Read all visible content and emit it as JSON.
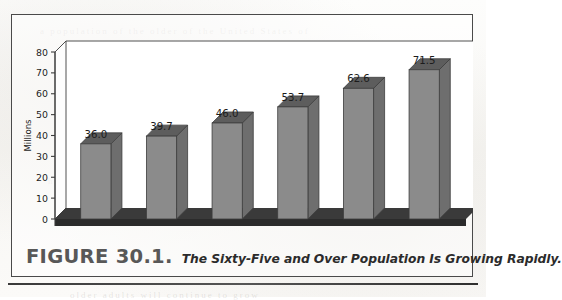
{
  "figure": {
    "number_label": "FIGURE 30.1.",
    "title": "The Sixty-Five and Over Population Is Growing Rapidly.",
    "ghost_lines": [
      "a population of the older of the United States of",
      "the increase in the number of persons over",
      "has been a steady rise in the proportion",
      "older adults will continue to grow"
    ]
  },
  "chart_data": {
    "type": "bar",
    "title": "",
    "subtitle": "",
    "xlabel": "",
    "ylabel": "Millions",
    "categories": [
      "2004",
      "2010",
      "2015",
      "2020",
      "2025",
      "2030"
    ],
    "values": [
      36.0,
      39.7,
      46.0,
      53.7,
      62.6,
      71.5
    ],
    "data_labels": [
      "36.0",
      "39.7",
      "46.0",
      "53.7",
      "62.6",
      "71.5"
    ],
    "yticks": [
      0,
      10,
      20,
      30,
      40,
      50,
      60,
      70,
      80
    ],
    "ytick_labels": [
      "0",
      "10",
      "20",
      "30",
      "40",
      "50",
      "60",
      "70",
      "80"
    ],
    "ylim": [
      0,
      80
    ],
    "grid": false,
    "legend": false,
    "legend_position": "none",
    "three_d": true,
    "colors": {
      "bar_front": "#8b8b8b",
      "bar_top": "#5d5d5d",
      "bar_side": "#6e6e6e",
      "floor": "#2b2b2b",
      "axis": "#3c3c3c",
      "wall": "#ffffff",
      "text": "#1c1c1c"
    }
  }
}
